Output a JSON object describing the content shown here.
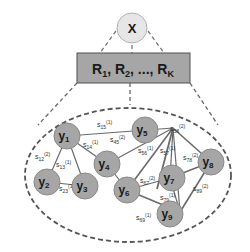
{
  "diagram": {
    "top_node": {
      "label": "X",
      "fill": "#e6e6e6",
      "stroke": "#b0b0b0"
    },
    "relation_box": {
      "label": "R",
      "items": [
        "1",
        "2",
        "K"
      ],
      "separator": ", ..., ",
      "fill": "#a6a6a6",
      "stroke": "#505050"
    },
    "cluster_stroke": "#555555",
    "node_fill": "#a6a6a6",
    "node_stroke": "#8a8a8a",
    "nodes": [
      {
        "id": "y1",
        "label": "y",
        "sub": "1"
      },
      {
        "id": "y2",
        "label": "y",
        "sub": "2"
      },
      {
        "id": "y3",
        "label": "y",
        "sub": "3"
      },
      {
        "id": "y4",
        "label": "y",
        "sub": "4"
      },
      {
        "id": "y5",
        "label": "y",
        "sub": "5"
      },
      {
        "id": "y6",
        "label": "y",
        "sub": "6"
      },
      {
        "id": "y7",
        "label": "y",
        "sub": "7"
      },
      {
        "id": "y8",
        "label": "y",
        "sub": "8"
      },
      {
        "id": "y9",
        "label": "y",
        "sub": "9"
      }
    ],
    "edges": [
      {
        "from": "y1",
        "to": "y5",
        "label": "s",
        "sub": "15",
        "sup": "(1)"
      },
      {
        "from": "y1",
        "to": "y4",
        "label": "s",
        "sub": "14",
        "sup": "(1)"
      },
      {
        "from": "y1",
        "to": "y2",
        "label": "s",
        "sub": "12",
        "sup": "(2)"
      },
      {
        "from": "y1",
        "to": "y3",
        "label": "s",
        "sub": "13",
        "sup": "(1)"
      },
      {
        "from": "y2",
        "to": "y3",
        "label": "s",
        "sub": "23",
        "sup": "(1)"
      },
      {
        "from": "y4",
        "to": "y5",
        "label": "s",
        "sub": "45",
        "sup": "(2)"
      },
      {
        "from": "y5",
        "to": "y6",
        "label": "s",
        "sub": "56",
        "sup": "(1)"
      },
      {
        "from": "y5",
        "to": "y8",
        "label": "s",
        "sub": "58",
        "sup": "(2)"
      },
      {
        "from": "y5",
        "to": "y7",
        "label": "s",
        "sub": "57",
        "sup": "(1)"
      },
      {
        "from": "y5",
        "to": "y9",
        "label": "s",
        "sub": "59",
        "sup": "(2)"
      },
      {
        "from": "y6",
        "to": "y7",
        "label": "s",
        "sub": "67",
        "sup": "(2)"
      },
      {
        "from": "y7",
        "to": "y8",
        "label": "s",
        "sub": "78",
        "sup": "(2)"
      },
      {
        "from": "y7",
        "to": "y9",
        "label": "s",
        "sub": "79",
        "sup": "(1)"
      },
      {
        "from": "y8",
        "to": "y9",
        "label": "s",
        "sub": "89",
        "sup": "(2)"
      },
      {
        "from": "y6",
        "to": "y9",
        "label": "s",
        "sub": "69",
        "sup": "(1)"
      }
    ]
  }
}
